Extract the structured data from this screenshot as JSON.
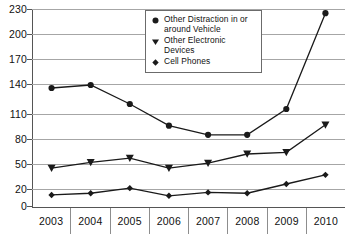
{
  "chart_data": {
    "type": "line",
    "title": "",
    "subtitle": "",
    "xlabel": "",
    "ylabel": "",
    "categories": [
      "2003",
      "2004",
      "2005",
      "2006",
      "2007",
      "2008",
      "2009",
      "2010"
    ],
    "x": [
      2003,
      2004,
      2005,
      2006,
      2007,
      2008,
      2009,
      2010
    ],
    "ylim": [
      0,
      230
    ],
    "yticks": [
      0,
      20,
      50,
      80,
      110,
      140,
      170,
      200,
      230
    ],
    "ytick_labels": [
      "0",
      "20",
      "50",
      "80",
      "110",
      "140",
      "170",
      "200",
      "230"
    ],
    "grid": true,
    "legend_position": "top-center",
    "series": [
      {
        "name": "Other Distraction in or around Vehicle",
        "marker": "circle",
        "values": [
          136,
          139,
          120,
          96,
          85,
          85,
          115,
          225
        ]
      },
      {
        "name": "Other Electronic Devices",
        "marker": "triangle-down",
        "values": [
          45,
          52,
          57,
          45,
          51,
          62,
          64,
          97
        ]
      },
      {
        "name": "Cell Phones",
        "marker": "diamond",
        "values": [
          13,
          15,
          21,
          12,
          16,
          15,
          26,
          37
        ]
      }
    ],
    "colors": {
      "series": "#1a1a1a",
      "gridline": "#a6a6a6",
      "axis": "#555555",
      "legend_border": "#6b6b6b",
      "background": "#ffffff",
      "text": "#111111"
    }
  },
  "legend": {
    "items": [
      {
        "label_line1": "Other Distraction in or",
        "label_line2": "around Vehicle",
        "marker": "circle-marker"
      },
      {
        "label_line1": "Other Electronic Devices",
        "label_line2": "",
        "marker": "triangle-down-marker"
      },
      {
        "label_line1": "Cell Phones",
        "label_line2": "",
        "marker": "diamond-marker"
      }
    ]
  }
}
